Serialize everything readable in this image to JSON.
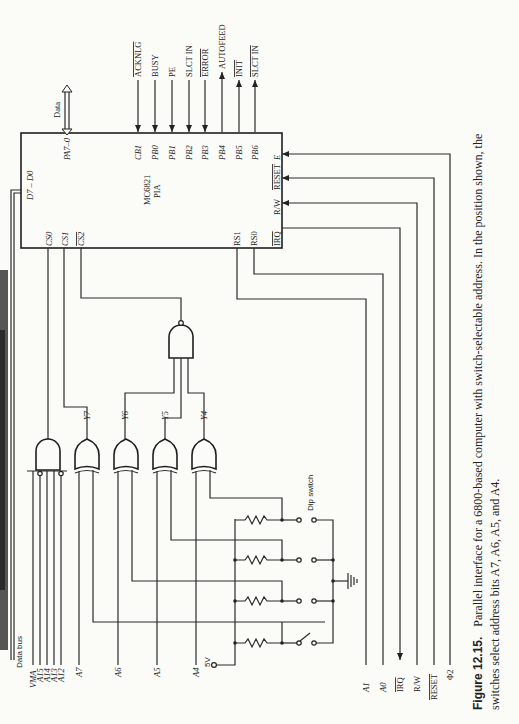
{
  "figure": {
    "caption_label": "Figure 12.15.",
    "caption_line1": "Parallel interface for a 6800-based computer with switch-selectable address. In the position shown, the",
    "caption_line2": "switches select address bits A7, A6, A5, and A4."
  },
  "pia": {
    "name": "MC6821",
    "type": "PIA",
    "data_pins": "D7 – D0",
    "port_a": "PA7–0",
    "port_a_signal": "Data",
    "chip_selects": [
      "CS0",
      "CS1",
      "CS2"
    ],
    "register_selects": [
      "RS1",
      "RS0"
    ],
    "control_pins": [
      "IRQ",
      "R/W",
      "RESET",
      "E"
    ],
    "port_b_pins": [
      {
        "pin": "CB1",
        "signal": "ACKNLG",
        "direction": "in"
      },
      {
        "pin": "PB0",
        "signal": "BUSY",
        "direction": "in"
      },
      {
        "pin": "PB1",
        "signal": "PE",
        "direction": "in"
      },
      {
        "pin": "PB2",
        "signal": "SLCT IN",
        "direction": "in"
      },
      {
        "pin": "PB3",
        "signal": "ERROR",
        "direction": "in"
      },
      {
        "pin": "PB4",
        "signal": "AUTOFEED",
        "direction": "out"
      },
      {
        "pin": "PB5",
        "signal": "INIT",
        "direction": "out"
      },
      {
        "pin": "PB6",
        "signal": "SLCT IN",
        "direction": "out"
      }
    ]
  },
  "bus": {
    "data_bus_label": "Data bus",
    "address_inputs": [
      "VMA",
      "A15",
      "A14",
      "A13",
      "A12",
      "A7",
      "A6",
      "A5",
      "A4"
    ],
    "control_lines": [
      "A1",
      "A0",
      "IRQ",
      "R/W",
      "RESET",
      "Φ2"
    ],
    "supply": "5V"
  },
  "gates": {
    "xor_outputs": [
      "Y7",
      "Y6",
      "Y5",
      "Y4"
    ]
  },
  "switch": {
    "label": "Dip switch"
  }
}
